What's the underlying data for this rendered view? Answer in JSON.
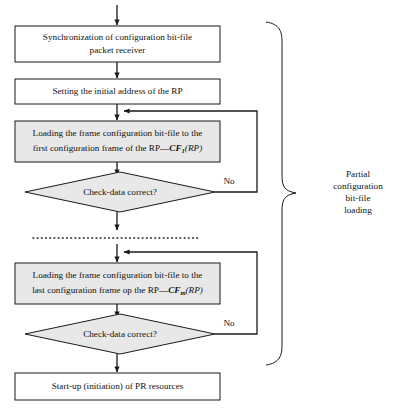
{
  "diagram": {
    "background_color": "#ffffff",
    "line_color": "#1a1a1a",
    "box_fill_white": "#ffffff",
    "box_fill_gray": "#e8e8e8"
  },
  "nodes": {
    "sync": {
      "type": "process",
      "line1": "Synchronization of configuration bit-file",
      "line2": "packet receiver"
    },
    "set_address": {
      "type": "process",
      "line1": "Setting the initial address of the RP"
    },
    "load_first": {
      "type": "process",
      "line1": "Loading the frame configuration bit-file to the",
      "line2_prefix": "first configuration frame of the RP—",
      "symbol": "CF",
      "subscript": "1",
      "argument": "(RP)"
    },
    "check_first": {
      "type": "decision",
      "line1": "Check-data correct?"
    },
    "load_last": {
      "type": "process",
      "line1": "Loading the frame configuration bit-file to the",
      "line2_prefix": "last configuration frame op the RP—",
      "symbol": "CF",
      "subscript": "m",
      "argument": "(RP)"
    },
    "check_last": {
      "type": "decision",
      "line1": "Check-data correct?"
    },
    "startup": {
      "type": "process",
      "line1": "Start-up (initiation) of PR resources"
    }
  },
  "edges": {
    "no_label_first": "No",
    "no_label_last": "No"
  },
  "annotation": {
    "brace_label_line1": "Partial",
    "brace_label_line2": "configuration",
    "brace_label_line3": "bit-file",
    "brace_label_line4": "loading"
  }
}
